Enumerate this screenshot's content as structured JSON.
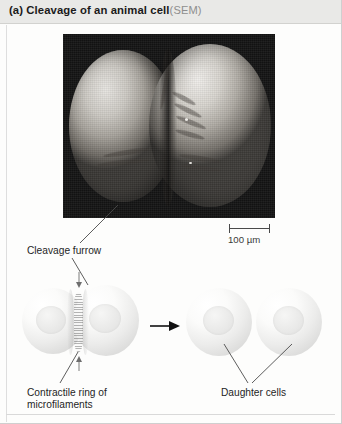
{
  "figure": {
    "panel_label": "(a)",
    "header_title": "(a) Cleavage of an animal cell",
    "header_technique": "(SEM)"
  },
  "micrograph": {
    "name": "sem-micrograph-dividing-cell",
    "description": "Scanning electron micrograph of an animal cell undergoing cleavage",
    "background_color": "#141414",
    "scale_bar": {
      "label": "100 µm",
      "value": 100,
      "unit": "µm"
    }
  },
  "labels": {
    "cleavage_furrow": "Cleavage furrow",
    "contractile_ring": "Contractile ring of\nmicrofilaments",
    "daughter_cells": "Daughter cells"
  },
  "diagram": {
    "stage_one_name": "cleaving-cell-with-contractile-ring",
    "stage_two_name": "separated-daughter-cells",
    "transition_arrow": "→",
    "cell_count_stage_one": 2,
    "cell_count_stage_two": 2
  },
  "colors": {
    "header_band": "#e9e9e7",
    "header_text": "#1b1b1b",
    "technique_text": "#8e8e8e",
    "label_text": "#1f1f1f",
    "leader_line": "#4b4b4b",
    "page_background": "#fdfdfc"
  }
}
